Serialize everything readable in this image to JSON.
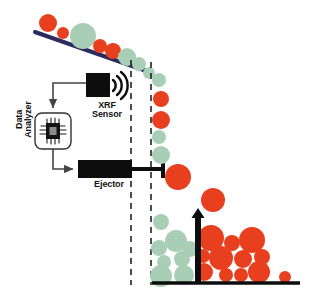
{
  "diagram": {
    "labels": {
      "xrf_sensor": "XRF\nSensor",
      "data_analyzer": "Data\nAnalyzer",
      "ejector": "Ejector"
    },
    "icons": {
      "chip": "microchip-icon",
      "signal": "signal-waves-icon",
      "sensor_box": "xrf-sensor-box",
      "ejector_box": "ejector-box",
      "piston": "ejector-piston",
      "divider": "splitter-divider",
      "belt": "conveyor-belt",
      "ground": "ground-baseline",
      "trajectory_left": "trajectory-dashed-line-left",
      "trajectory_right": "trajectory-dashed-line-right"
    },
    "colors": {
      "ore_reject": "#E8401F",
      "ore_accept": "#A9CEB6",
      "belt": "#2B2B5E",
      "equipment": "#0D0D0D",
      "connector": "#444444",
      "background": "#FFFFFF",
      "dashed_line": "#222222",
      "chip_core": "#8C8C8C"
    },
    "geometry": {
      "belt_line": {
        "x1": 35,
        "y1": 32,
        "x2": 152,
        "y2": 73
      },
      "ground_line": {
        "x1": 152,
        "y1": 283,
        "x2": 300,
        "y2": 283
      },
      "dashed_left_x": 131,
      "dashed_right_x": 151,
      "dashed_y_top": 60,
      "dashed_y_bottom": 285,
      "divider": {
        "x": 195,
        "y_top": 210,
        "y_bottom": 283,
        "width": 7
      }
    },
    "boxes": {
      "xrf_sensor": {
        "x": 86,
        "y": 73,
        "w": 24,
        "h": 24
      },
      "data_analyzer": {
        "x": 35,
        "y": 113,
        "w": 36,
        "h": 36
      },
      "ejector": {
        "x": 78,
        "y": 160,
        "w": 54,
        "h": 18
      }
    },
    "connectors": [
      {
        "name": "sensor-to-analyzer",
        "from": "xrf_sensor",
        "to": "data_analyzer"
      },
      {
        "name": "analyzer-to-ejector",
        "from": "data_analyzer",
        "to": "ejector"
      }
    ],
    "particles": {
      "on_belt": [
        {
          "cx": 48,
          "cy": 23,
          "r": 9,
          "type": "reject"
        },
        {
          "cx": 63,
          "cy": 33,
          "r": 6,
          "type": "reject"
        },
        {
          "cx": 83,
          "cy": 36,
          "r": 13,
          "type": "accept"
        },
        {
          "cx": 100,
          "cy": 46,
          "r": 7,
          "type": "reject"
        },
        {
          "cx": 113,
          "cy": 51,
          "r": 8,
          "type": "reject"
        },
        {
          "cx": 127,
          "cy": 57,
          "r": 9,
          "type": "accept"
        },
        {
          "cx": 139,
          "cy": 64,
          "r": 7,
          "type": "accept"
        },
        {
          "cx": 149,
          "cy": 73,
          "r": 6,
          "type": "accept"
        }
      ],
      "falling": [
        {
          "cx": 159,
          "cy": 80,
          "r": 7,
          "type": "accept"
        },
        {
          "cx": 161,
          "cy": 99,
          "r": 8,
          "type": "reject"
        },
        {
          "cx": 161,
          "cy": 120,
          "r": 9,
          "type": "reject"
        },
        {
          "cx": 159,
          "cy": 137,
          "r": 7,
          "type": "accept"
        },
        {
          "cx": 161,
          "cy": 155,
          "r": 9,
          "type": "accept"
        },
        {
          "cx": 178,
          "cy": 177,
          "r": 13,
          "type": "reject"
        },
        {
          "cx": 213,
          "cy": 200,
          "r": 12,
          "type": "reject"
        },
        {
          "cx": 161,
          "cy": 222,
          "r": 8,
          "type": "accept"
        }
      ],
      "pile_accept": [
        {
          "cx": 159,
          "cy": 248,
          "r": 8,
          "type": "accept"
        },
        {
          "cx": 176,
          "cy": 241,
          "r": 11,
          "type": "accept"
        },
        {
          "cx": 190,
          "cy": 249,
          "r": 8,
          "type": "accept"
        },
        {
          "cx": 164,
          "cy": 262,
          "r": 7,
          "type": "accept"
        },
        {
          "cx": 182,
          "cy": 259,
          "r": 8,
          "type": "accept"
        },
        {
          "cx": 161,
          "cy": 276,
          "r": 11,
          "type": "accept"
        },
        {
          "cx": 184,
          "cy": 275,
          "r": 10,
          "type": "accept"
        }
      ],
      "pile_reject": [
        {
          "cx": 211,
          "cy": 238,
          "r": 13,
          "type": "reject"
        },
        {
          "cx": 232,
          "cy": 243,
          "r": 8,
          "type": "reject"
        },
        {
          "cx": 252,
          "cy": 240,
          "r": 13,
          "type": "reject"
        },
        {
          "cx": 203,
          "cy": 256,
          "r": 7,
          "type": "reject"
        },
        {
          "cx": 221,
          "cy": 258,
          "r": 12,
          "type": "reject"
        },
        {
          "cx": 243,
          "cy": 259,
          "r": 9,
          "type": "reject"
        },
        {
          "cx": 262,
          "cy": 257,
          "r": 8,
          "type": "reject"
        },
        {
          "cx": 204,
          "cy": 272,
          "r": 9,
          "type": "reject"
        },
        {
          "cx": 226,
          "cy": 275,
          "r": 7,
          "type": "reject"
        },
        {
          "cx": 241,
          "cy": 275,
          "r": 7,
          "type": "reject"
        },
        {
          "cx": 259,
          "cy": 272,
          "r": 11,
          "type": "reject"
        },
        {
          "cx": 285,
          "cy": 277,
          "r": 6,
          "type": "reject"
        }
      ]
    }
  }
}
